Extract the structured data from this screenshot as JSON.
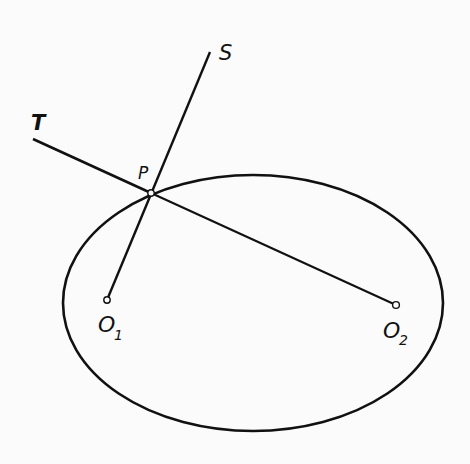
{
  "diagram": {
    "type": "ellipse-focal-property",
    "colors": {
      "stroke": "#111111",
      "background": "#fbfbfb"
    },
    "ellipse": {
      "cx": 253,
      "cy": 303,
      "rx": 190,
      "ry": 128
    },
    "points": {
      "P": {
        "label": "P",
        "x": 151,
        "y": 193
      },
      "O1": {
        "label": "O",
        "sub": "1",
        "x": 107,
        "y": 300
      },
      "O2": {
        "label": "O",
        "sub": "2",
        "x": 396,
        "y": 305
      }
    },
    "lines": {
      "normal": {
        "label": "S",
        "x1": 107,
        "y1": 300,
        "x2": 210,
        "y2": 52
      },
      "tangent": {
        "label": "T",
        "x1": 33,
        "y1": 139,
        "x2": 396,
        "y2": 305
      }
    },
    "labels": {
      "S": "S",
      "T": "T",
      "P": "P",
      "O1_main": "O",
      "O1_sub": "1",
      "O2_main": "O",
      "O2_sub": "2"
    }
  }
}
